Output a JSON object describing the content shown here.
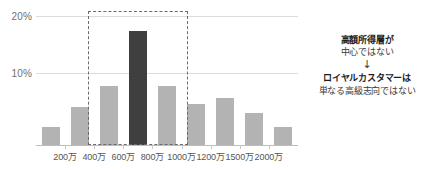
{
  "chart_data": {
    "type": "bar",
    "title": "",
    "subtitle": "",
    "xlabel": "",
    "ylabel": "",
    "categories": [
      "",
      "200万",
      "400万",
      "600万",
      "800万",
      "1000万",
      "1200万",
      "1500万",
      "2000万"
    ],
    "values": [
      3,
      6.5,
      10,
      19.5,
      10,
      7,
      8,
      5.5,
      3
    ],
    "highlight_index": 3,
    "ylim": [
      0,
      22
    ],
    "yticks": [
      10,
      20
    ],
    "ytick_labels": [
      "10%",
      "20%"
    ],
    "xtick_labels": [
      "200万",
      "400万",
      "600万",
      "800万",
      "1000万",
      "1200万",
      "1500万",
      "2000万"
    ],
    "grid": true,
    "legend": "none",
    "bar_color": "#b3b3b3",
    "highlight_color": "#3f3f3f",
    "grid_color": "#dcdcdc",
    "axis_color": "#bdbdbd"
  },
  "axis": {
    "y_label_20": "20%",
    "y_label_10": "10%",
    "x_labels": [
      {
        "text": "200万"
      },
      {
        "text": "400万"
      },
      {
        "text": "600万"
      },
      {
        "text": "800万"
      },
      {
        "text": "1000万"
      },
      {
        "text": "1200万"
      },
      {
        "text": "1500万"
      },
      {
        "text": "2000万"
      }
    ]
  },
  "highlight_box": {
    "label": "400万～1000万",
    "border_color": "#6b6b6b"
  },
  "annotation": {
    "line1": "高額所得層が",
    "line2": "中心ではない",
    "arrow": "↓",
    "line3": "ロイヤルカスタマーは",
    "line4": "単なる高級志向ではない"
  }
}
